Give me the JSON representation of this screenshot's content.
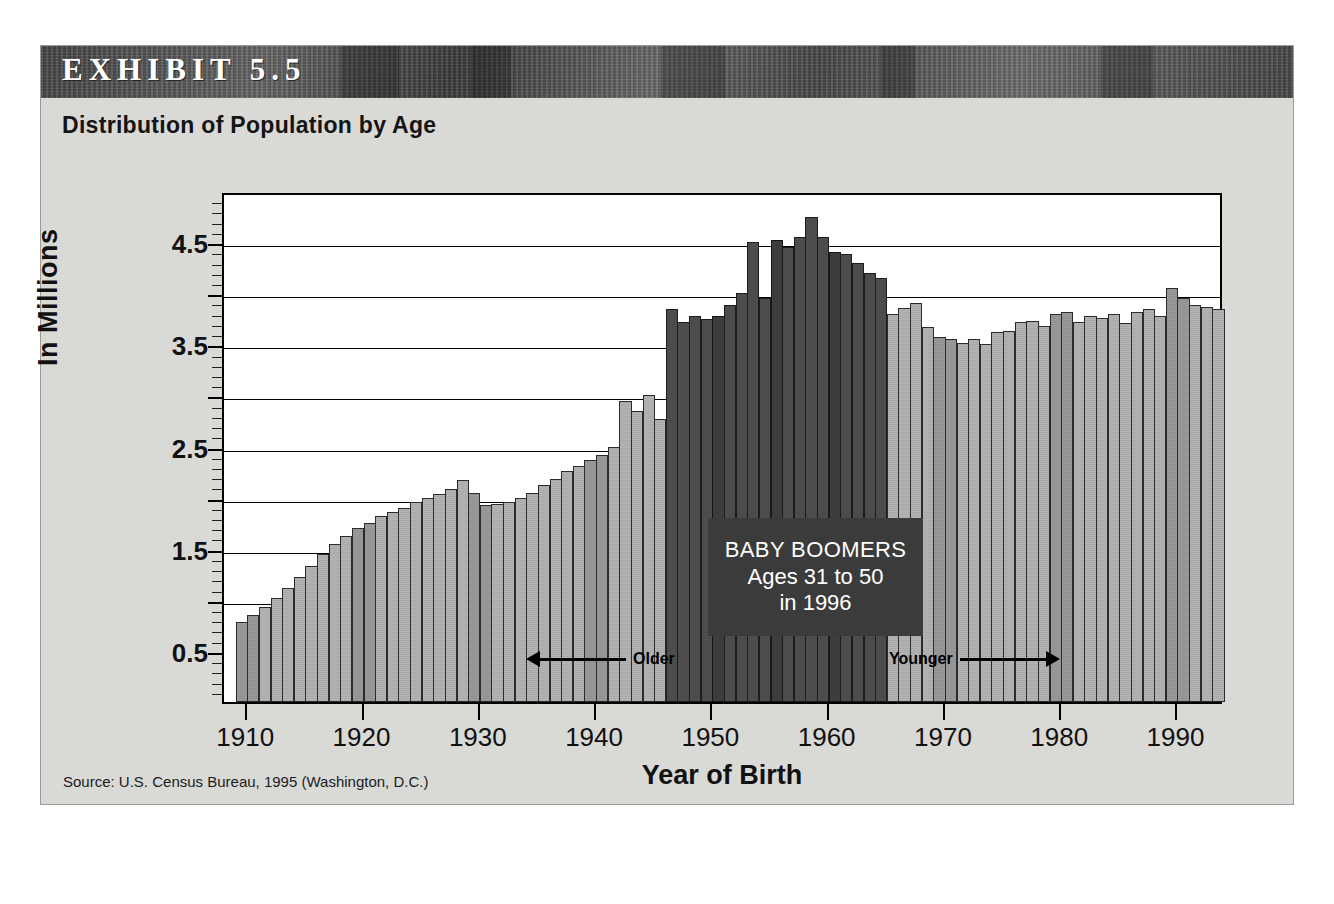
{
  "exhibit": {
    "label": "EXHIBIT 5.5",
    "title": "Distribution of Population by Age",
    "source": "Source: U.S. Census Bureau, 1995 (Washington, D.C.)"
  },
  "callout": {
    "line1": "BABY BOOMERS",
    "line2": "Ages 31 to 50",
    "line3": "in 1996"
  },
  "annotations": {
    "older": "Older",
    "younger": "Younger"
  },
  "colors": {
    "banner": "#5b5b5b",
    "panel": "#d9d9d6",
    "bar_light": "#b4b4b4",
    "bar_mid": "#9a9a9a",
    "bar_boomer": "#4f4f4f",
    "callout_bg": "#3b3b3b",
    "plot_bg": "#ffffff",
    "axis": "#000000"
  },
  "chart_data": {
    "type": "bar",
    "title": "Distribution of Population by Age",
    "subtitle": "EXHIBIT 5.5",
    "xlabel": "Year of Birth",
    "ylabel": "In Millions",
    "xlim": [
      1908,
      1994
    ],
    "ylim": [
      0,
      5.0
    ],
    "grid": true,
    "grid_values": [
      1.0,
      1.5,
      2.0,
      2.5,
      3.0,
      3.5,
      4.0,
      4.5
    ],
    "ytick_labels": [
      "0.5",
      "1.5",
      "2.5",
      "3.5",
      "4.5"
    ],
    "ytick_values": [
      0.5,
      1.5,
      2.5,
      3.5,
      4.5
    ],
    "xtick_labels": [
      "1910",
      "1920",
      "1930",
      "1940",
      "1950",
      "1960",
      "1970",
      "1980",
      "1990"
    ],
    "xtick_values": [
      1910,
      1920,
      1930,
      1940,
      1950,
      1960,
      1970,
      1980,
      1990
    ],
    "legend": [],
    "highlight_band": {
      "label": "BABY BOOMERS",
      "from_year": 1946,
      "to_year": 1964,
      "color": "#4f4f4f"
    },
    "bar_unit": "millions of births",
    "x": [
      1909,
      1910,
      1911,
      1912,
      1913,
      1914,
      1915,
      1916,
      1917,
      1918,
      1919,
      1920,
      1921,
      1922,
      1923,
      1924,
      1925,
      1926,
      1927,
      1928,
      1929,
      1930,
      1931,
      1932,
      1933,
      1934,
      1935,
      1936,
      1937,
      1938,
      1939,
      1940,
      1941,
      1942,
      1943,
      1944,
      1945,
      1946,
      1947,
      1948,
      1949,
      1950,
      1951,
      1952,
      1953,
      1954,
      1955,
      1956,
      1957,
      1958,
      1959,
      1960,
      1961,
      1962,
      1963,
      1964,
      1965,
      1966,
      1967,
      1968,
      1969,
      1970,
      1971,
      1972,
      1973,
      1974,
      1975,
      1976,
      1977,
      1978,
      1979,
      1980,
      1981,
      1982,
      1983,
      1984,
      1985,
      1986,
      1987,
      1988,
      1989,
      1990,
      1991,
      1992,
      1993
    ],
    "values": [
      0.78,
      0.85,
      0.93,
      1.02,
      1.12,
      1.22,
      1.33,
      1.45,
      1.55,
      1.62,
      1.7,
      1.75,
      1.82,
      1.86,
      1.9,
      1.96,
      2.0,
      2.04,
      2.08,
      2.17,
      2.05,
      1.93,
      1.94,
      1.96,
      2.0,
      2.05,
      2.12,
      2.18,
      2.26,
      2.31,
      2.37,
      2.42,
      2.5,
      2.95,
      2.85,
      3.0,
      2.77,
      3.85,
      3.72,
      3.78,
      3.75,
      3.78,
      3.88,
      4.0,
      4.5,
      3.95,
      4.52,
      4.45,
      4.55,
      4.75,
      4.55,
      4.4,
      4.38,
      4.3,
      4.2,
      4.15,
      3.8,
      3.86,
      3.9,
      3.67,
      3.57,
      3.55,
      3.51,
      3.55,
      3.5,
      3.62,
      3.63,
      3.72,
      3.73,
      3.68,
      3.8,
      3.82,
      3.72,
      3.78,
      3.76,
      3.8,
      3.71,
      3.82,
      3.85,
      3.78,
      4.05,
      3.95,
      3.88,
      3.87,
      3.85
    ]
  }
}
